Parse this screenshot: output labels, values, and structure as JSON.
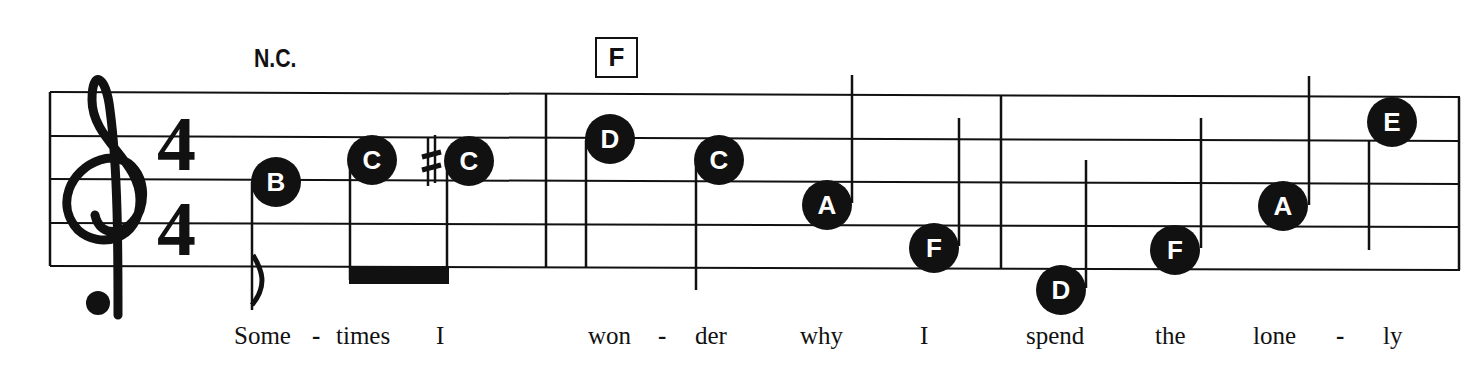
{
  "score": {
    "clef": "treble",
    "time_signature": {
      "top": "4",
      "bottom": "4"
    },
    "chords": [
      {
        "label": "N.C.",
        "boxed": false
      },
      {
        "label": "F",
        "boxed": true
      }
    ],
    "measures": [
      {
        "notes": [
          {
            "name": "B",
            "accidental": "",
            "x": 276,
            "y": 182
          },
          {
            "name": "C",
            "accidental": "",
            "x": 372,
            "y": 160
          },
          {
            "name": "C",
            "accidental": "♯",
            "x": 468,
            "y": 161
          }
        ]
      },
      {
        "notes": [
          {
            "name": "D",
            "accidental": "",
            "x": 610,
            "y": 139
          },
          {
            "name": "C",
            "accidental": "",
            "x": 719,
            "y": 160
          },
          {
            "name": "A",
            "accidental": "",
            "x": 827,
            "y": 205
          },
          {
            "name": "F",
            "accidental": "",
            "x": 934,
            "y": 248
          }
        ]
      },
      {
        "notes": [
          {
            "name": "D",
            "accidental": "",
            "x": 1061,
            "y": 290
          },
          {
            "name": "F",
            "accidental": "",
            "x": 1175,
            "y": 250
          },
          {
            "name": "A",
            "accidental": "",
            "x": 1283,
            "y": 206
          },
          {
            "name": "E",
            "accidental": "",
            "x": 1392,
            "y": 122
          }
        ]
      }
    ],
    "lyrics": [
      {
        "text": "Some",
        "x": 234
      },
      {
        "text": "-",
        "x": 310
      },
      {
        "text": "times",
        "x": 336
      },
      {
        "text": "I",
        "x": 436
      },
      {
        "text": "won",
        "x": 588
      },
      {
        "text": "-",
        "x": 655
      },
      {
        "text": "der",
        "x": 695
      },
      {
        "text": "why",
        "x": 800
      },
      {
        "text": "I",
        "x": 920
      },
      {
        "text": "spend",
        "x": 1026
      },
      {
        "text": "the",
        "x": 1155
      },
      {
        "text": "lone",
        "x": 1253
      },
      {
        "text": "-",
        "x": 1333
      },
      {
        "text": "ly",
        "x": 1383
      }
    ]
  }
}
